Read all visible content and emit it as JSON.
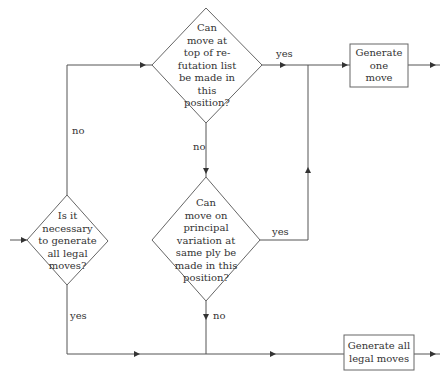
{
  "nodes": {
    "decision_all_legal": {
      "type": "decision",
      "text": "Is it\nnecessary\nto generate\nall legal\nmoves?"
    },
    "decision_refutation": {
      "type": "decision",
      "text": "Can\nmove at\ntop of re-\nfutation list\nbe made in\nthis\nposition?"
    },
    "decision_principal": {
      "type": "decision",
      "text": "Can\nmove on\nprincipal\nvariation at\nsame ply be\nmade in this\nposition?"
    },
    "process_one_move": {
      "type": "process",
      "text": "Generate\none\nmove"
    },
    "process_all_moves": {
      "type": "process",
      "text": "Generate all\nlegal moves"
    }
  },
  "edges": {
    "all_legal_no": "no",
    "all_legal_yes": "yes",
    "refutation_yes": "yes",
    "refutation_no": "no",
    "principal_yes": "yes",
    "principal_no": "no"
  },
  "colors": {
    "line": "#555555",
    "text": "#333333",
    "background": "#ffffff"
  }
}
